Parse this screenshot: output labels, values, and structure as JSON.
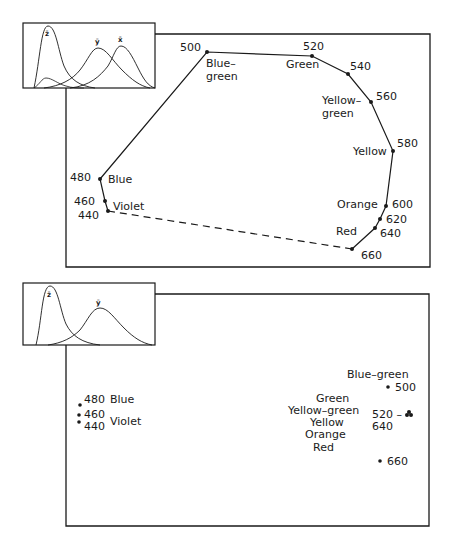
{
  "colors": {
    "ink": "#1a1a1a",
    "background": "#ffffff"
  },
  "top_panel": {
    "inset": {
      "curves": [
        "z-bar",
        "y-bar",
        "x-bar"
      ],
      "labels": {
        "z": "z̄",
        "y": "ȳ",
        "x": "x̄"
      }
    },
    "points": [
      {
        "wl": "440",
        "label": "Violet"
      },
      {
        "wl": "460",
        "label": ""
      },
      {
        "wl": "480",
        "label": "Blue"
      },
      {
        "wl": "500",
        "label": "Blue–",
        "label2": "green"
      },
      {
        "wl": "520",
        "label": "Green"
      },
      {
        "wl": "540",
        "label": ""
      },
      {
        "wl": "560",
        "label": "Yellow–",
        "label2": "green"
      },
      {
        "wl": "580",
        "label": "Yellow"
      },
      {
        "wl": "600",
        "label": "Orange"
      },
      {
        "wl": "620",
        "label": ""
      },
      {
        "wl": "640",
        "label": ""
      },
      {
        "wl": "660",
        "label": "Red"
      }
    ]
  },
  "bottom_panel": {
    "inset": {
      "curves": [
        "z-bar",
        "y-bar"
      ],
      "labels": {
        "z": "z̄",
        "y": "ȳ"
      }
    },
    "left_group": {
      "wl_480": "480",
      "label_blue": "Blue",
      "wl_460": "460",
      "wl_440": "440",
      "label_violet": "Violet"
    },
    "right_group": {
      "label_blue_green": "Blue–green",
      "wl_500": "500",
      "labels_cluster": [
        "Green",
        "Yellow–green",
        "Yellow",
        "Orange",
        "Red"
      ],
      "wl_520_dash": "520 –",
      "wl_640": "640",
      "wl_660": "660"
    }
  }
}
